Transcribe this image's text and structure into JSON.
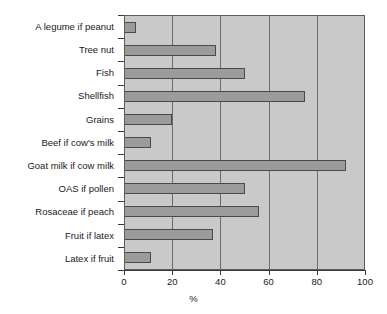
{
  "chart_data": {
    "type": "bar",
    "orientation": "horizontal",
    "title": "",
    "xlabel": "%",
    "ylabel": "",
    "xlim": [
      0,
      100
    ],
    "xticks": [
      0,
      20,
      40,
      60,
      80,
      100
    ],
    "grid": true,
    "legend": false,
    "categories": [
      "A legume if peanut",
      "Tree nut",
      "Fish",
      "Shellfish",
      "Grains",
      "Beef if cow's milk",
      "Goat milk if cow milk",
      "OAS if pollen",
      "Rosaceae if peach",
      "Fruit if latex",
      "Latex if fruit"
    ],
    "values": [
      5,
      38,
      50,
      75,
      20,
      11,
      92,
      50,
      56,
      37,
      11
    ],
    "colors": {
      "bar_fill": "#9b9b9b",
      "bar_border": "#4a4a4a",
      "plot_background": "#c9c9c9",
      "gridline": "#6b6b6b",
      "axis": "#3a3a3a",
      "text": "#1a1a1a",
      "page_background": "#ffffff"
    }
  }
}
